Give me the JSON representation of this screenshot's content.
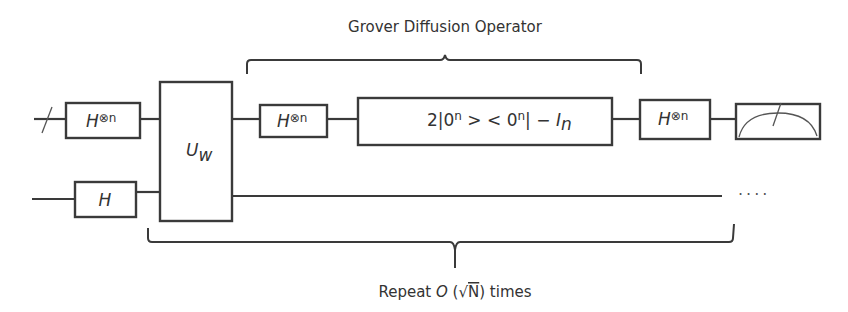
{
  "diagram": {
    "type": "quantum-circuit",
    "labels": {
      "diffusion_operator": "Grover Diffusion Operator",
      "repeat_prefix": "Repeat ",
      "repeat_big_o": "O",
      "repeat_paren_open": " (",
      "repeat_sqrt": "√",
      "repeat_n": "N",
      "repeat_suffix": ") times"
    },
    "gates": {
      "hadamard_n_base": "H",
      "hadamard_n_sup": "⊗n",
      "hadamard_single": "H",
      "oracle_base": "U",
      "oracle_sub": "w",
      "diffusion_formula_main": "2|0",
      "diffusion_formula_sup1": "n",
      "diffusion_formula_mid": " > < 0",
      "diffusion_formula_sup2": "n",
      "diffusion_formula_end": "| − ",
      "diffusion_identity": "I",
      "diffusion_identity_sub": "n"
    },
    "wires": [
      {
        "name": "register-n-qubits",
        "y": 119,
        "multi_qubit": true
      },
      {
        "name": "ancilla-qubit",
        "y": 196,
        "multi_qubit": false
      }
    ],
    "continuation": "····",
    "colors": {
      "stroke": "#3a3a3a",
      "text": "#333333",
      "background": "#ffffff"
    }
  }
}
